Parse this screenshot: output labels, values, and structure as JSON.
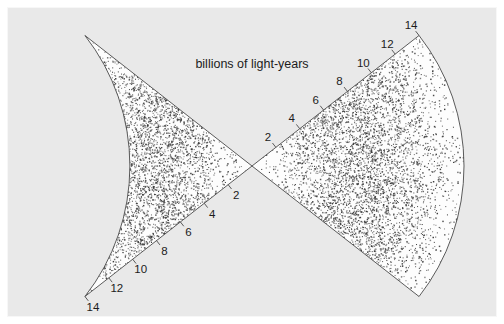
{
  "figure": {
    "width": 504,
    "height": 324,
    "background_color": "#e9e9e9",
    "frame_color": "#fcfcfc",
    "wedge_fill_color": "#fdfdfd",
    "wedge_stroke_color": "#4a4a4a",
    "dot_color": "#3a3a3a",
    "text_color": "#1c1c1c"
  },
  "caption": {
    "text": "billions of light-years"
  },
  "chart_data": {
    "type": "scatter",
    "title": "",
    "subtitle": "",
    "xlabel": "",
    "ylabel": "",
    "axis_caption": "billions of light-years",
    "coordinate_system": "polar-double-wedge",
    "grid": false,
    "legend": null,
    "radial_axis": {
      "label": "billions of light-years",
      "unit": "billions of light-years",
      "min": 0,
      "max": 14,
      "tick_values": [
        2,
        4,
        6,
        8,
        10,
        12,
        14
      ],
      "tick_labels": [
        "2",
        "4",
        "6",
        "8",
        "10",
        "12",
        "14"
      ],
      "tick_interval": 2,
      "tick_side": "upper-edge-of-each-wedge"
    },
    "wedges": [
      {
        "name": "left-wedge",
        "apex_x": 252,
        "apex_y": 166,
        "opens_toward": "left",
        "half_angle_degrees": 38,
        "bisector_angle_degrees": 180,
        "outer_radius_px": 212,
        "point_count": 4200
      },
      {
        "name": "right-wedge",
        "apex_x": 252,
        "apex_y": 166,
        "opens_toward": "right",
        "half_angle_degrees": 38,
        "bisector_angle_degrees": 0,
        "outer_radius_px": 212,
        "point_count": 4200
      }
    ],
    "radial_density_profile": {
      "note": "Galaxy surface density rises from apex, peaks near 6-9 billion light-years, then thins toward the 14 billion light-year edge.",
      "r_fraction": [
        0.0,
        0.1,
        0.2,
        0.3,
        0.4,
        0.5,
        0.6,
        0.7,
        0.8,
        0.9,
        1.0
      ],
      "relative_density": [
        0.02,
        0.18,
        0.45,
        0.72,
        0.92,
        1.0,
        0.95,
        0.78,
        0.52,
        0.26,
        0.08
      ]
    },
    "total_points": 8400
  }
}
